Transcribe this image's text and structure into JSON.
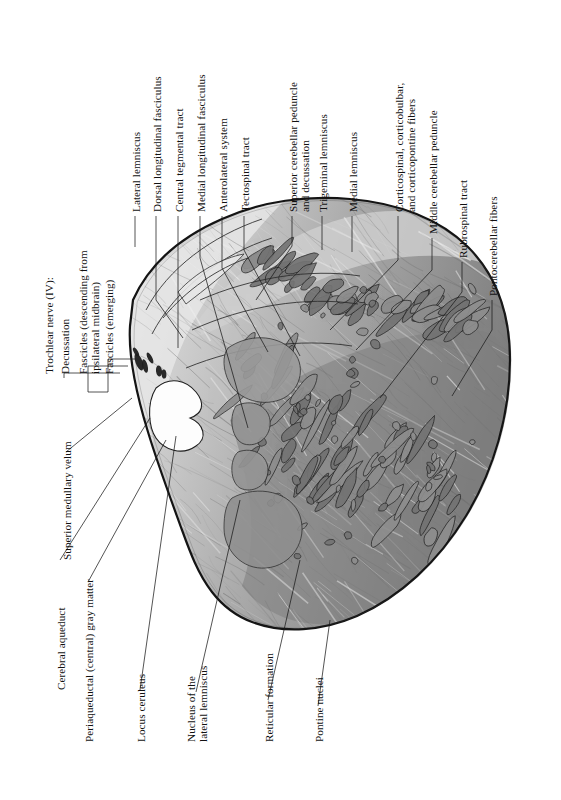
{
  "figure": {
    "type": "histological-cross-section",
    "orientation": "labels rotated 90 degrees counter-clockwise (page read sideways)",
    "background_color": "#ffffff",
    "ink_color": "#111111",
    "tissue_colors": {
      "outline": "#141414",
      "white_matter_dark": "#7d7d7d",
      "gray_matter_mid": "#a9a9a9",
      "pale_tracts": "#cfcfcf",
      "highlight": "#e6e6e6",
      "cavity_white": "#fdfdfd",
      "nerve_dark": "#1d1d1d"
    }
  },
  "labels_top_left_group": [
    {
      "id": "lateral-lemniscus",
      "text": "Lateral lemniscus"
    },
    {
      "id": "dorsal-longitudinal-fasciculus",
      "text": "Dorsal longitudinal fasciculus"
    },
    {
      "id": "central-tegmental-tract",
      "text": "Central tegmental tract"
    },
    {
      "id": "medial-longitudinal-fasciculus",
      "text": "Medial longitudinal fasciculus"
    },
    {
      "id": "anterolateral-system",
      "text": "Anterolateral system"
    },
    {
      "id": "tectospinal-tract",
      "text": "Tectospinal tract"
    }
  ],
  "labels_top_right_group": [
    {
      "id": "superior-cerebellar-peduncle",
      "line1": "Superior cerebellar peduncle",
      "line2": "and decussation"
    },
    {
      "id": "trigeminal-lemniscus",
      "text": "Trigeminal lemniscus"
    },
    {
      "id": "medial-lemniscus",
      "text": "Medial lemniscus"
    },
    {
      "id": "corticospinal-corticobulbar",
      "line1": "Corticospinal, corticobulbar,",
      "line2": "and corticopontine fibers"
    },
    {
      "id": "middle-cerebellar-peduncle",
      "text": "Middle cerebellar peduncle"
    },
    {
      "id": "rubrospinal-tract",
      "text": "Rubrospinal tract"
    },
    {
      "id": "pontocerebellar-fibers",
      "text": "Pontocerebellar fibers"
    }
  ],
  "labels_left_group": {
    "heading": "Trochlear nerve (IV):",
    "items": [
      {
        "id": "decussation",
        "text": "Decussation"
      },
      {
        "id": "fascicles-descending",
        "line1": "Fascicles (descending from",
        "line2": "ipsilateral midbrain)"
      },
      {
        "id": "fascicles-emerging",
        "text": "Fascicles (emerging)"
      }
    ]
  },
  "labels_lower_left_group": [
    {
      "id": "superior-medullary-velum",
      "text": "Superior medullary velum"
    },
    {
      "id": "cerebral-aqueduct",
      "text": "Cerebral aqueduct"
    },
    {
      "id": "periaqueductal-gray",
      "text": "Periaqueductal (central) gray matter"
    }
  ],
  "labels_bottom_group": [
    {
      "id": "locus-ceruleus",
      "text": "Locus ceruleus"
    },
    {
      "id": "nucleus-lateral-lemniscus",
      "line1": "Nucleus of the",
      "line2": "lateral lemniscus"
    },
    {
      "id": "reticular-formation",
      "text": "Reticular formation"
    },
    {
      "id": "pontine-nuclei",
      "text": "Pontine nuclei"
    }
  ]
}
